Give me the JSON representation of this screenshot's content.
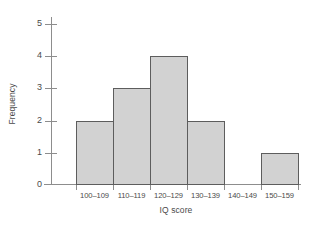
{
  "chart_data": {
    "type": "bar",
    "title": "",
    "xlabel": "IQ score",
    "ylabel": "Frequency",
    "categories": [
      "100–109",
      "110–119",
      "120–129",
      "130–139",
      "140–149",
      "150–159"
    ],
    "values": [
      2,
      3,
      4,
      2,
      0,
      1
    ],
    "ylim": [
      0,
      5
    ],
    "yticks": [
      "0",
      "1",
      "2",
      "3",
      "4",
      "5"
    ],
    "grid": false,
    "legend": null,
    "series": [
      {
        "name": "Frequency",
        "values": [
          2,
          3,
          4,
          2,
          0,
          1
        ]
      }
    ],
    "style": {
      "bar_fill": "#d2d2d2",
      "bar_border": "#5d5d5d",
      "axis_color": "#8d8d8d",
      "text_color": "#4a4a4a",
      "background": "#ffffff"
    }
  }
}
